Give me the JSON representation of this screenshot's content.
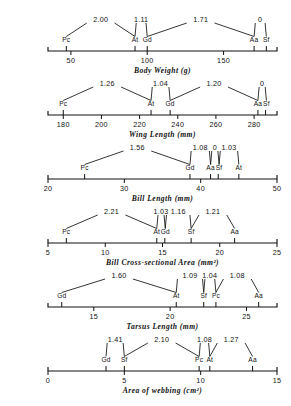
{
  "figure": {
    "taxa_codes": [
      "Pc",
      "At",
      "Gd",
      "Aa",
      "Sf"
    ],
    "axis_color": "#111111",
    "background": "#ffffff"
  },
  "chart_data": [
    {
      "type": "scatter",
      "title": "",
      "xlabel": "Body Weight (g)",
      "ylabel": "",
      "xlim": [
        35,
        185
      ],
      "ticks": [
        50,
        100,
        150
      ],
      "tick_labels": [
        "50",
        "100",
        "150"
      ],
      "grid": false,
      "legend": "none",
      "points": [
        {
          "label": "Pc",
          "x": 47
        },
        {
          "label": "At",
          "x": 92
        },
        {
          "label": "Gd",
          "x": 100
        },
        {
          "label": "Aa",
          "x": 170
        },
        {
          "label": "Sf",
          "x": 178
        }
      ],
      "ratios": [
        {
          "value": "2.00",
          "from": "Pc",
          "to": "At"
        },
        {
          "value": "1.11",
          "from": "At",
          "to": "Gd"
        },
        {
          "value": "1.71",
          "from": "Gd",
          "to": "Aa"
        },
        {
          "value": "0",
          "from": "Aa",
          "to": "Sf"
        }
      ]
    },
    {
      "type": "scatter",
      "title": "",
      "xlabel": "Wing Length (mm)",
      "ylabel": "",
      "xlim": [
        172,
        292
      ],
      "ticks": [
        180,
        200,
        220,
        240,
        260,
        280
      ],
      "tick_labels": [
        "180",
        "200",
        "220",
        "240",
        "260",
        "280"
      ],
      "grid": false,
      "legend": "none",
      "points": [
        {
          "label": "Pc",
          "x": 180
        },
        {
          "label": "At",
          "x": 226
        },
        {
          "label": "Gd",
          "x": 236
        },
        {
          "label": "Aa",
          "x": 282
        },
        {
          "label": "Sf",
          "x": 286
        }
      ],
      "ratios": [
        {
          "value": "1.26",
          "from": "Pc",
          "to": "At"
        },
        {
          "value": "1.04",
          "from": "At",
          "to": "Gd"
        },
        {
          "value": "1.20",
          "from": "Gd",
          "to": "Aa"
        },
        {
          "value": "0",
          "from": "Aa",
          "to": "Sf"
        }
      ]
    },
    {
      "type": "scatter",
      "title": "",
      "xlabel": "Bill Length (mm)",
      "ylabel": "",
      "xlim": [
        20,
        50
      ],
      "ticks": [
        20,
        30,
        40,
        50
      ],
      "tick_labels": [
        "20",
        "30",
        "40",
        "50"
      ],
      "grid": false,
      "legend": "none",
      "points": [
        {
          "label": "Pc",
          "x": 24.8
        },
        {
          "label": "Gd",
          "x": 38.6
        },
        {
          "label": "Aa",
          "x": 41.3
        },
        {
          "label": "Sf",
          "x": 42.3
        },
        {
          "label": "At",
          "x": 45.0
        }
      ],
      "ratios": [
        {
          "value": "1.56",
          "from": "Pc",
          "to": "Gd"
        },
        {
          "value": "1.08",
          "from": "Gd",
          "to": "Aa"
        },
        {
          "value": "0",
          "from": "Aa",
          "to": "Sf"
        },
        {
          "value": "1.03",
          "from": "Sf",
          "to": "At"
        }
      ]
    },
    {
      "type": "scatter",
      "title": "",
      "xlabel": "Bill Cross-sectional Area (mm²)",
      "ylabel": "",
      "xlim": [
        5,
        25
      ],
      "ticks": [
        5,
        10,
        15,
        20,
        25
      ],
      "tick_labels": [
        "5",
        "10",
        "15",
        "20",
        "25"
      ],
      "grid": false,
      "legend": "none",
      "points": [
        {
          "label": "Pc",
          "x": 6.6
        },
        {
          "label": "At",
          "x": 14.5
        },
        {
          "label": "Gd",
          "x": 15.2
        },
        {
          "label": "Sf",
          "x": 17.5
        },
        {
          "label": "Aa",
          "x": 21.3
        }
      ],
      "ratios": [
        {
          "value": "2.21",
          "from": "Pc",
          "to": "At"
        },
        {
          "value": "1.03",
          "from": "At",
          "to": "Gd"
        },
        {
          "value": "1.16",
          "from": "Gd",
          "to": "Sf"
        },
        {
          "value": "1.21",
          "from": "Sf",
          "to": "Aa"
        }
      ]
    },
    {
      "type": "scatter",
      "title": "",
      "xlabel": "Tarsus Length (mm)",
      "ylabel": "",
      "xlim": [
        12,
        27
      ],
      "ticks": [
        15,
        20,
        25
      ],
      "tick_labels": [
        "15",
        "20",
        "25"
      ],
      "grid": false,
      "legend": "none",
      "points": [
        {
          "label": "Gd",
          "x": 12.9
        },
        {
          "label": "At",
          "x": 20.4
        },
        {
          "label": "Sf",
          "x": 22.2
        },
        {
          "label": "Pc",
          "x": 23.0
        },
        {
          "label": "Aa",
          "x": 25.8
        }
      ],
      "ratios": [
        {
          "value": "1.60",
          "from": "Gd",
          "to": "At"
        },
        {
          "value": "1.09",
          "from": "At",
          "to": "Sf"
        },
        {
          "value": "1.04",
          "from": "Sf",
          "to": "Pc"
        },
        {
          "value": "1.08",
          "from": "Pc",
          "to": "Aa"
        }
      ]
    },
    {
      "type": "scatter",
      "title": "",
      "xlabel": "Area of webbing (cm²)",
      "ylabel": "",
      "xlim": [
        0,
        15
      ],
      "ticks": [
        0,
        5,
        10,
        15
      ],
      "tick_labels": [
        "0",
        "5",
        "10",
        "15"
      ],
      "grid": false,
      "legend": "none",
      "points": [
        {
          "label": "Gd",
          "x": 3.8
        },
        {
          "label": "Sf",
          "x": 5.0
        },
        {
          "label": "Pc",
          "x": 9.9
        },
        {
          "label": "At",
          "x": 10.6
        },
        {
          "label": "Aa",
          "x": 13.4
        }
      ],
      "ratios": [
        {
          "value": "1.41",
          "from": "Gd",
          "to": "Sf"
        },
        {
          "value": "2.10",
          "from": "Sf",
          "to": "Pc"
        },
        {
          "value": "1.08",
          "from": "Pc",
          "to": "At"
        },
        {
          "value": "1.27",
          "from": "At",
          "to": "Aa"
        }
      ]
    }
  ]
}
